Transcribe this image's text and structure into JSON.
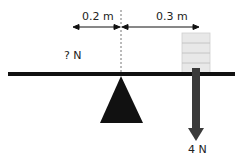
{
  "diagram": {
    "distance_left_label": "0.2 m",
    "distance_right_label": "0.3 m",
    "unknown_force_label": "? N",
    "known_force_label": "4 N",
    "colors": {
      "beam": "#111111",
      "fulcrum": "#111111",
      "weights_fill": "#e8e8e8",
      "weights_lines": "#bdbdbd",
      "arrow": "#3a3a3a",
      "dashed_line": "#777777"
    }
  }
}
